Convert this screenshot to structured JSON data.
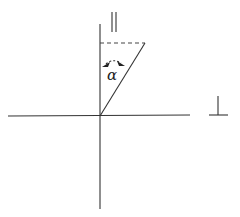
{
  "diagram": {
    "labels": {
      "parallel_symbol": "||",
      "perpendicular_symbol": "⊥",
      "angle": "α"
    }
  }
}
